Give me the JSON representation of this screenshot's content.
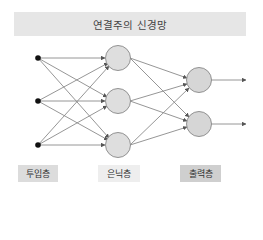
{
  "title": "연결주의 신경망",
  "layers": {
    "input": {
      "label": "투입층",
      "nodes": 3
    },
    "hidden": {
      "label": "은닉층",
      "nodes": 3
    },
    "output": {
      "label": "출력층",
      "nodes": 2
    }
  },
  "colors": {
    "title_bg": "#e6e6e6",
    "node_fill": "#dddddd",
    "node_stroke": "#888888",
    "edge": "#888888",
    "input_node": "#111111"
  }
}
